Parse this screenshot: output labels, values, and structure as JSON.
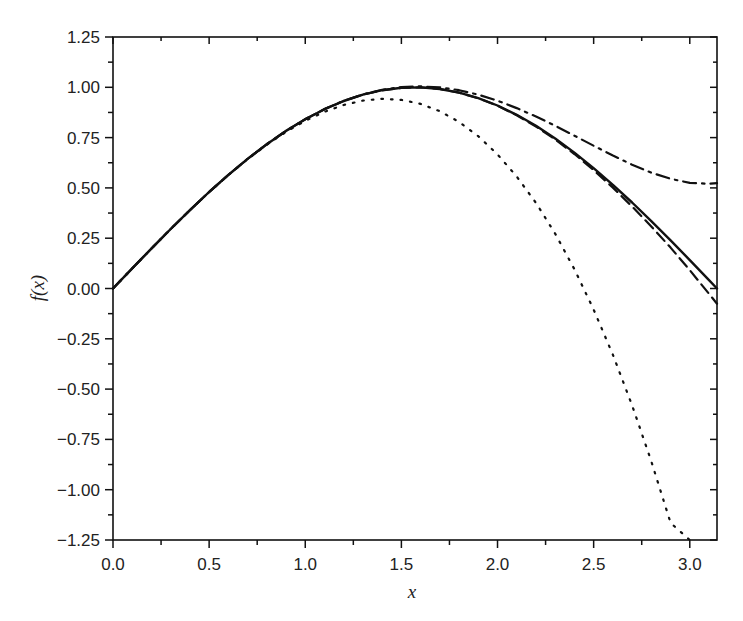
{
  "chart_data": {
    "type": "line",
    "title": "",
    "xlabel": "x",
    "ylabel": "f(x)",
    "xlim": [
      0,
      3.14159
    ],
    "ylim": [
      -1.25,
      1.25
    ],
    "grid": false,
    "legend": null,
    "x_ticks": [
      0.0,
      0.5,
      1.0,
      1.5,
      2.0,
      2.5,
      3.0
    ],
    "x_tick_labels": [
      "0.0",
      "0.5",
      "1.0",
      "1.5",
      "2.0",
      "2.5",
      "3.0"
    ],
    "y_ticks": [
      1.25,
      1.0,
      0.75,
      0.5,
      0.25,
      0.0,
      -0.25,
      -0.5,
      -0.75,
      -1.0,
      -1.25
    ],
    "y_tick_labels": [
      "1.25",
      "1.00",
      "0.75",
      "0.50",
      "0.25",
      "0.00",
      "−0.25",
      "−0.50",
      "−0.75",
      "−1.00",
      "−1.25"
    ],
    "x": [
      0.0,
      0.1,
      0.2,
      0.3,
      0.4,
      0.5,
      0.6,
      0.7,
      0.8,
      0.9,
      1.0,
      1.1,
      1.2,
      1.3,
      1.4,
      1.5,
      1.6,
      1.7,
      1.8,
      1.9,
      2.0,
      2.1,
      2.2,
      2.3,
      2.4,
      2.5,
      2.6,
      2.7,
      2.8,
      2.9,
      3.0,
      3.1,
      3.1416
    ],
    "series": [
      {
        "name": "sin(x)",
        "style": "solid",
        "color": "#111111",
        "values": [
          0,
          0.0998,
          0.1987,
          0.2955,
          0.3894,
          0.4794,
          0.5646,
          0.6442,
          0.7174,
          0.7833,
          0.8415,
          0.8912,
          0.932,
          0.9636,
          0.9854,
          0.9975,
          0.9996,
          0.9917,
          0.9738,
          0.9463,
          0.9093,
          0.8632,
          0.8085,
          0.7457,
          0.6755,
          0.5985,
          0.5155,
          0.4274,
          0.335,
          0.2392,
          0.1411,
          0.0416,
          0.0
        ]
      },
      {
        "name": "Taylor order 3",
        "style": "dotted",
        "color": "#111111",
        "values": [
          0,
          0.0998,
          0.1987,
          0.2955,
          0.3893,
          0.4792,
          0.564,
          0.6428,
          0.7147,
          0.7785,
          0.8333,
          0.8782,
          0.912,
          0.9338,
          0.9427,
          0.9375,
          0.9173,
          0.8812,
          0.828,
          0.7569,
          0.6667,
          0.5565,
          0.4253,
          0.2722,
          0.096,
          -0.1042,
          -0.3293,
          -0.5805,
          -0.8587,
          -1.1648,
          -1.25,
          null,
          null
        ]
      },
      {
        "name": "Taylor order 5",
        "style": "dash-dot",
        "color": "#111111",
        "values": [
          0,
          0.0998,
          0.1987,
          0.2955,
          0.3894,
          0.4794,
          0.5646,
          0.6442,
          0.7174,
          0.7834,
          0.8417,
          0.8916,
          0.9327,
          0.9647,
          0.9875,
          1.0008,
          1.0047,
          0.9995,
          0.9855,
          0.9632,
          0.9333,
          0.8968,
          0.8548,
          0.8086,
          0.7596,
          0.7096,
          0.6608,
          0.6153,
          0.5756,
          0.5452,
          0.525,
          0.5204,
          0.524
        ]
      },
      {
        "name": "Taylor order 7",
        "style": "dashed",
        "color": "#111111",
        "values": [
          0,
          0.0998,
          0.1987,
          0.2955,
          0.3894,
          0.4794,
          0.5646,
          0.6442,
          0.7174,
          0.7833,
          0.8415,
          0.8912,
          0.932,
          0.9636,
          0.9854,
          0.9974,
          0.9994,
          0.9914,
          0.9734,
          0.9454,
          0.9079,
          0.8611,
          0.8054,
          0.7413,
          0.6686,
          0.5885,
          0.5014,
          0.4077,
          0.308,
          0.2032,
          0.0911,
          -0.0262,
          -0.0753
        ]
      }
    ]
  }
}
